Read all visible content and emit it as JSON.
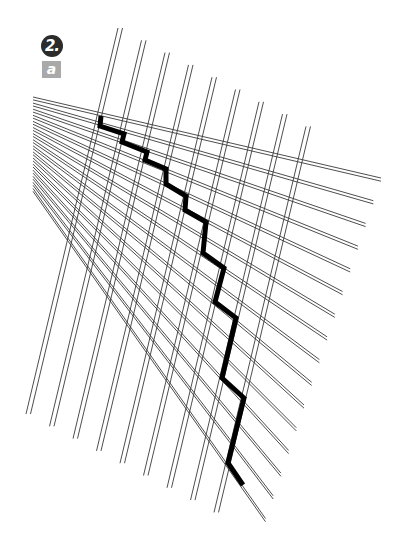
{
  "labels": {
    "step_number": "2.",
    "sub_step": "a"
  },
  "colors": {
    "thin_line": "#3a3a3a",
    "bold_path": "#000000",
    "step_badge_bg": "#2b2b2b",
    "sub_badge_bg": "#a9a9a9"
  },
  "grid": {
    "vertical_pairs": {
      "count": 9,
      "top_start": [
        118,
        28
      ],
      "bottom_start": [
        26,
        414
      ],
      "step": [
        23.5,
        12.3
      ],
      "pair_offset": 4.5
    },
    "horizontal_pairs": {
      "count": 16,
      "left_start": [
        33,
        97
      ],
      "left_step": [
        0,
        6.1
      ],
      "right_start": [
        381,
        178
      ],
      "right_step": [
        -7.7,
        22.7
      ],
      "pair_offset": 3.2
    }
  },
  "bold_path": {
    "points": [
      [
        101,
        116
      ],
      [
        100,
        126
      ],
      [
        124,
        134
      ],
      [
        122,
        142
      ],
      [
        147,
        152
      ],
      [
        145,
        160
      ],
      [
        166,
        169
      ],
      [
        166,
        184
      ],
      [
        186,
        196
      ],
      [
        185,
        210
      ],
      [
        206,
        222
      ],
      [
        203,
        253
      ],
      [
        224,
        268
      ],
      [
        215,
        302
      ],
      [
        236,
        318
      ],
      [
        222,
        378
      ],
      [
        244,
        398
      ],
      [
        228,
        463
      ],
      [
        243,
        485
      ]
    ],
    "stroke_width": 5
  }
}
